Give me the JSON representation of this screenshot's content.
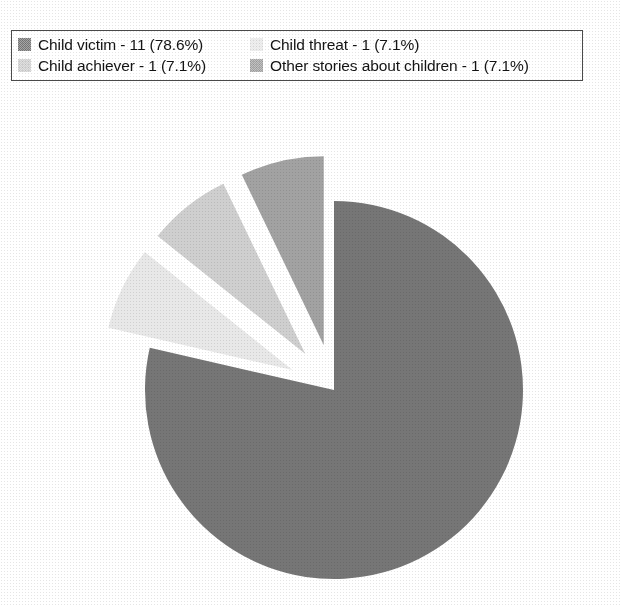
{
  "chart_data": {
    "type": "pie",
    "title": "",
    "total": 14,
    "legend_position": "top",
    "grid": false,
    "start_angle_deg": 0,
    "direction": "clockwise",
    "categories": [
      "Child victim",
      "Child threat",
      "Child achiever",
      "Other stories about children"
    ],
    "values": [
      11,
      1,
      1,
      1
    ],
    "percentages": [
      78.6,
      7.1,
      7.1,
      7.1
    ],
    "slices": [
      {
        "label": "Child victim",
        "count": 11,
        "percent": 78.6,
        "legend_text": "Child victim - 11 (78.6%)",
        "color": "#767676",
        "exploded": false,
        "start_angle_deg": 0,
        "sweep_deg": 282.9
      },
      {
        "label": "Child threat",
        "count": 1,
        "percent": 7.1,
        "legend_text": "Child threat - 1 (7.1%)",
        "color": "#e8e8e8",
        "exploded": true,
        "start_angle_deg": 282.9,
        "sweep_deg": 25.7
      },
      {
        "label": "Child achiever",
        "count": 1,
        "percent": 7.1,
        "legend_text": "Child achiever - 1 (7.1%)",
        "color": "#cfcfcf",
        "exploded": true,
        "start_angle_deg": 308.6,
        "sweep_deg": 25.7
      },
      {
        "label": "Other stories about children",
        "count": 1,
        "percent": 7.1,
        "legend_text": "Other stories about children - 1 (7.1%)",
        "color": "#a2a2a2",
        "exploded": true,
        "start_angle_deg": 334.3,
        "sweep_deg": 25.7
      }
    ],
    "xlabel": "",
    "ylabel": ""
  },
  "legend": {
    "rows": [
      {
        "left": {
          "swatch_color": "#767676",
          "swatch_name": "legend-swatch-child-victim",
          "text": "Child victim - 11 (78.6%)"
        },
        "right": {
          "swatch_color": "#e8e8e8",
          "swatch_name": "legend-swatch-child-threat",
          "text": "Child threat - 1 (7.1%)"
        }
      },
      {
        "left": {
          "swatch_color": "#cfcfcf",
          "swatch_name": "legend-swatch-child-achiever",
          "text": "Child achiever - 1 (7.1%)"
        },
        "right": {
          "swatch_color": "#a2a2a2",
          "swatch_name": "legend-swatch-other-stories",
          "text": "Other stories about children - 1 (7.1%)"
        }
      }
    ]
  },
  "geometry": {
    "center_x": 334,
    "center_y": 390,
    "radius": 189,
    "explode_offset": 46
  },
  "colors": {
    "background": "#ffffff",
    "border": "#4a4a4a",
    "text": "#141414"
  }
}
